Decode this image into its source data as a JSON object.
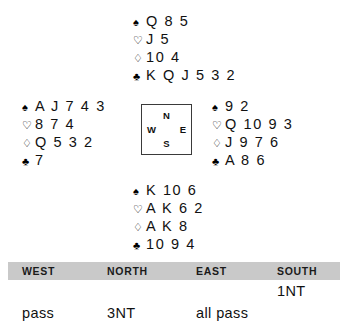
{
  "suits": {
    "spade": "♠",
    "heart": "♡",
    "diamond": "♢",
    "club": "♣"
  },
  "hands": {
    "north": {
      "label": "North",
      "spades": "Q 8 5",
      "hearts": "J 5",
      "diamonds": "10 4",
      "clubs": "K Q J 5 3 2"
    },
    "west": {
      "label": "West",
      "spades": "A J 7 4 3",
      "hearts": "8 7 4",
      "diamonds": "Q 5 3 2",
      "clubs": "7"
    },
    "east": {
      "label": "East",
      "spades": "9 2",
      "hearts": "Q 10 9 3",
      "diamonds": "J 9 7 6",
      "clubs": "A 8 6"
    },
    "south": {
      "label": "South",
      "spades": "K 10 6",
      "hearts": "A K 6 2",
      "diamonds": "A K 8",
      "clubs": "10 9 4"
    }
  },
  "compass": {
    "north": "N",
    "west": "W",
    "east": "E",
    "south": "S"
  },
  "auction": {
    "headers": {
      "west": "WEST",
      "north": "NORTH",
      "east": "EAST",
      "south": "SOUTH"
    },
    "rows": [
      {
        "west": "",
        "north": "",
        "east": "",
        "south": "1NT"
      },
      {
        "west": "pass",
        "north": "3NT",
        "east": "all pass",
        "south": ""
      }
    ],
    "header_background": "#c9c9c9"
  }
}
